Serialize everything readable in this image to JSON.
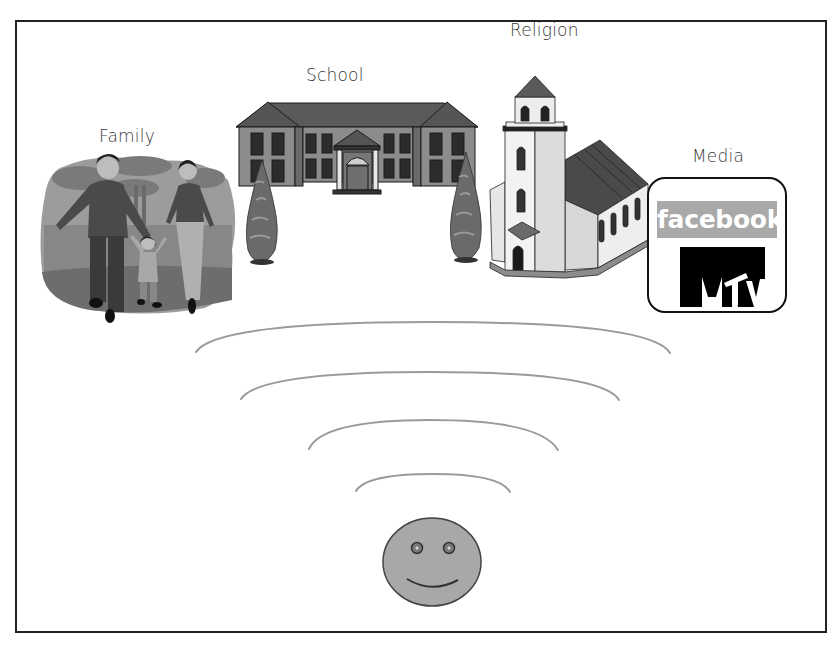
{
  "diagram": {
    "type": "socialization-influences",
    "labels": {
      "family": "Family",
      "school": "School",
      "religion": "Religion",
      "media": "Media"
    },
    "media_box": {
      "facebook": "facebook",
      "mtv": "MTV"
    },
    "center": {
      "icon": "smiley-face-icon",
      "ripples": 4
    },
    "colors": {
      "frame": "#222222",
      "ripple": "#9a9a9a",
      "face_fill": "#a8a8a8",
      "facebook_banner": "#a9a9a9",
      "mtv": "#000000",
      "roof": "#555555",
      "wall": "#8c8c8c"
    }
  }
}
